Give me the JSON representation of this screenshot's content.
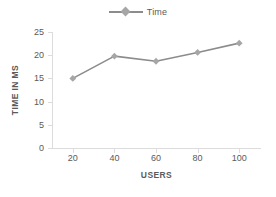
{
  "chart_data": {
    "type": "line",
    "title": "",
    "xlabel": "USERS",
    "ylabel": "TIME IN MS",
    "categories": [
      20,
      40,
      60,
      80,
      100
    ],
    "x": [
      20,
      40,
      60,
      80,
      100
    ],
    "series": [
      {
        "name": "Time",
        "values": [
          15.0,
          19.8,
          18.7,
          20.6,
          22.6
        ],
        "color": "#8c8c8c",
        "marker": "diamond",
        "marker_color": "#a6a6a6"
      }
    ],
    "xtick_labels": [
      "20",
      "40",
      "60",
      "80",
      "100"
    ],
    "ytick_labels": [
      "0",
      "5",
      "10",
      "15",
      "20",
      "25"
    ],
    "yticks": [
      0,
      5,
      10,
      15,
      20,
      25
    ],
    "ylim": [
      0,
      25
    ],
    "xlim": [
      10,
      110
    ],
    "grid": false,
    "legend": {
      "position": "top-center",
      "entries": [
        "Time"
      ]
    },
    "axis_color": "#dcdcdc",
    "text_color": "#5a5a5a"
  },
  "legend": {
    "time_label": "Time"
  },
  "axes": {
    "x_title": "USERS",
    "y_title": "TIME IN MS"
  }
}
